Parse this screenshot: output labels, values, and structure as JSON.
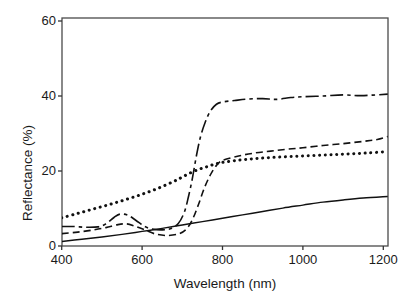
{
  "figure": {
    "background": "#ffffff",
    "frame_color": "#4a4a4a",
    "line_color": "#111111",
    "tick_color": "#333333"
  },
  "chart_data": {
    "type": "line",
    "title": "",
    "xlabel": "Wavelength (nm)",
    "ylabel": "Reflectance (%)",
    "xlim": [
      400,
      1211
    ],
    "ylim": [
      0,
      60
    ],
    "x_ticks": [
      400,
      600,
      800,
      1000,
      1200
    ],
    "y_ticks": [
      0,
      20,
      40,
      60
    ],
    "grid": false,
    "legend": "none",
    "series": [
      {
        "name": "solid-curve",
        "style": "solid",
        "color": "#111111",
        "points": [
          [
            400,
            1.2
          ],
          [
            450,
            1.8
          ],
          [
            500,
            2.4
          ],
          [
            550,
            3.1
          ],
          [
            600,
            3.9
          ],
          [
            650,
            4.7
          ],
          [
            700,
            5.6
          ],
          [
            750,
            6.5
          ],
          [
            800,
            7.4
          ],
          [
            850,
            8.3
          ],
          [
            900,
            9.2
          ],
          [
            950,
            10.1
          ],
          [
            1000,
            10.9
          ],
          [
            1050,
            11.7
          ],
          [
            1100,
            12.3
          ],
          [
            1150,
            12.8
          ],
          [
            1211,
            13.2
          ]
        ]
      },
      {
        "name": "dotted-curve",
        "style": "dotted",
        "color": "#111111",
        "points": [
          [
            400,
            7.5
          ],
          [
            440,
            8.7
          ],
          [
            480,
            9.9
          ],
          [
            520,
            11.1
          ],
          [
            560,
            12.4
          ],
          [
            600,
            13.8
          ],
          [
            640,
            15.4
          ],
          [
            680,
            17.3
          ],
          [
            700,
            18.4
          ],
          [
            720,
            19.5
          ],
          [
            740,
            20.4
          ],
          [
            760,
            21.1
          ],
          [
            780,
            21.8
          ],
          [
            800,
            22.3
          ],
          [
            840,
            22.9
          ],
          [
            880,
            23.3
          ],
          [
            920,
            23.6
          ],
          [
            960,
            23.8
          ],
          [
            1000,
            24.0
          ],
          [
            1040,
            24.2
          ],
          [
            1080,
            24.4
          ],
          [
            1120,
            24.6
          ],
          [
            1160,
            24.8
          ],
          [
            1200,
            25.1
          ]
        ]
      },
      {
        "name": "dash-dot-curve",
        "style": "dashdot",
        "color": "#111111",
        "points": [
          [
            400,
            5.2
          ],
          [
            430,
            5.2
          ],
          [
            460,
            5.0
          ],
          [
            490,
            5.1
          ],
          [
            510,
            5.9
          ],
          [
            530,
            7.6
          ],
          [
            545,
            8.5
          ],
          [
            565,
            8.2
          ],
          [
            585,
            6.8
          ],
          [
            605,
            5.3
          ],
          [
            625,
            4.5
          ],
          [
            650,
            4.3
          ],
          [
            670,
            4.6
          ],
          [
            690,
            6.0
          ],
          [
            705,
            9.0
          ],
          [
            715,
            13.0
          ],
          [
            725,
            18.0
          ],
          [
            735,
            24.0
          ],
          [
            745,
            29.0
          ],
          [
            757,
            33.0
          ],
          [
            770,
            36.0
          ],
          [
            785,
            37.8
          ],
          [
            800,
            38.4
          ],
          [
            830,
            38.8
          ],
          [
            865,
            39.2
          ],
          [
            900,
            39.3
          ],
          [
            935,
            39.1
          ],
          [
            970,
            39.6
          ],
          [
            1000,
            39.8
          ],
          [
            1050,
            40.0
          ],
          [
            1100,
            40.3
          ],
          [
            1145,
            40.1
          ],
          [
            1211,
            40.5
          ]
        ]
      },
      {
        "name": "dashed-curve",
        "style": "dashed",
        "color": "#111111",
        "points": [
          [
            400,
            3.3
          ],
          [
            440,
            3.7
          ],
          [
            480,
            4.3
          ],
          [
            510,
            4.9
          ],
          [
            540,
            5.7
          ],
          [
            562,
            5.9
          ],
          [
            582,
            5.3
          ],
          [
            605,
            4.4
          ],
          [
            630,
            3.3
          ],
          [
            660,
            2.8
          ],
          [
            690,
            3.2
          ],
          [
            710,
            4.5
          ],
          [
            725,
            7.0
          ],
          [
            740,
            11.0
          ],
          [
            755,
            15.5
          ],
          [
            770,
            19.0
          ],
          [
            785,
            21.5
          ],
          [
            800,
            22.8
          ],
          [
            840,
            24.0
          ],
          [
            880,
            24.8
          ],
          [
            920,
            25.3
          ],
          [
            960,
            25.8
          ],
          [
            1000,
            26.2
          ],
          [
            1050,
            26.8
          ],
          [
            1100,
            27.3
          ],
          [
            1150,
            27.9
          ],
          [
            1185,
            28.4
          ],
          [
            1211,
            29.2
          ]
        ]
      }
    ]
  }
}
